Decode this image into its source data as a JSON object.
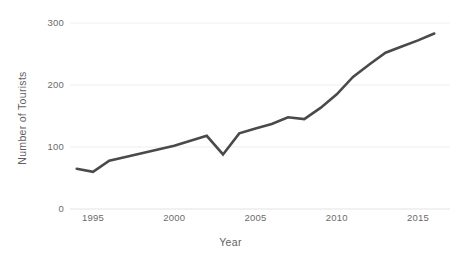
{
  "chart_data": {
    "type": "line",
    "title": "",
    "xlabel": "Year",
    "ylabel": "Number of Tourists",
    "xlim": [
      1994,
      2016
    ],
    "ylim": [
      0,
      310
    ],
    "grid": true,
    "legend": "none",
    "line_color": "#4a4a4a",
    "grid_color": "#eeeeee",
    "background": "#ffffff",
    "x_ticks": [
      "1995",
      "2000",
      "2005",
      "2010",
      "2015"
    ],
    "x_tick_values": [
      1995,
      2000,
      2005,
      2010,
      2015
    ],
    "y_ticks": [
      "0",
      "100",
      "200",
      "300"
    ],
    "y_tick_values": [
      0,
      100,
      200,
      300
    ],
    "x": [
      1994,
      1995,
      1996,
      1997,
      1998,
      1999,
      2000,
      2001,
      2002,
      2003,
      2004,
      2005,
      2006,
      2007,
      2008,
      2009,
      2010,
      2011,
      2012,
      2013,
      2014,
      2015,
      2016
    ],
    "values": [
      65,
      60,
      78,
      84,
      90,
      96,
      102,
      110,
      118,
      88,
      122,
      130,
      137,
      148,
      145,
      163,
      185,
      213,
      233,
      252,
      262,
      272,
      283
    ],
    "series": [
      {
        "name": "Number of Tourists",
        "values": [
          65,
          60,
          78,
          84,
          90,
          96,
          102,
          110,
          118,
          88,
          122,
          130,
          137,
          148,
          145,
          163,
          185,
          213,
          233,
          252,
          262,
          272,
          283
        ]
      }
    ]
  }
}
